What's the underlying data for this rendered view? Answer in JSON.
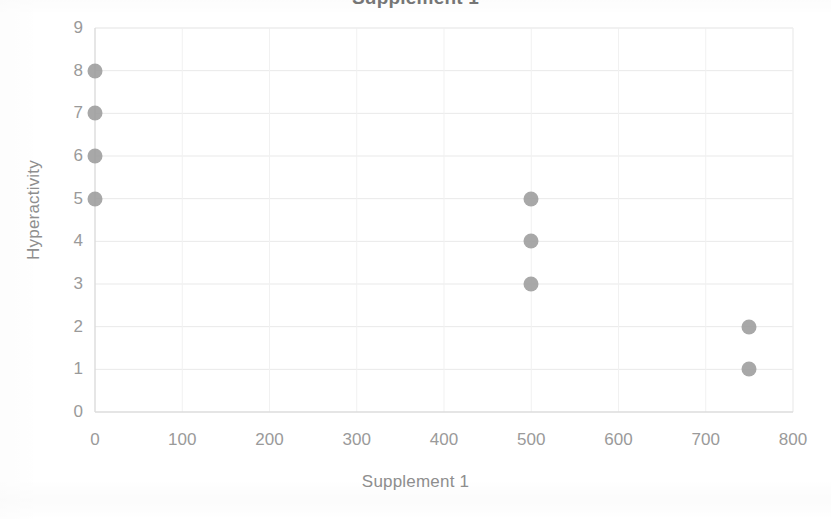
{
  "chart_data": {
    "type": "scatter",
    "title": "Supplement 1",
    "xlabel": "Supplement 1",
    "ylabel": "Hyperactivity",
    "xlim": [
      0,
      800
    ],
    "ylim": [
      0,
      9
    ],
    "x_ticks": [
      0,
      100,
      200,
      300,
      400,
      500,
      600,
      700,
      800
    ],
    "y_ticks": [
      0,
      1,
      2,
      3,
      4,
      5,
      6,
      7,
      8,
      9
    ],
    "grid": true,
    "legend": false,
    "marker_color": "#9c9c9c",
    "points": [
      {
        "x": 0,
        "y": 8
      },
      {
        "x": 0,
        "y": 7
      },
      {
        "x": 0,
        "y": 6
      },
      {
        "x": 0,
        "y": 5
      },
      {
        "x": 500,
        "y": 5
      },
      {
        "x": 500,
        "y": 4
      },
      {
        "x": 500,
        "y": 3
      },
      {
        "x": 750,
        "y": 2
      },
      {
        "x": 750,
        "y": 1
      }
    ],
    "series": [
      {
        "name": "Hyperactivity vs Supplement 1",
        "x": [
          0,
          0,
          0,
          0,
          500,
          500,
          500,
          750,
          750
        ],
        "values": [
          8,
          7,
          6,
          5,
          5,
          4,
          3,
          2,
          1
        ]
      }
    ]
  },
  "colors": {
    "marker": "#9c9c9c",
    "grid": "#e9e9e9",
    "axis": "#dcdcdc",
    "text": "#9a9a9a",
    "title": "#5a5a5a"
  }
}
